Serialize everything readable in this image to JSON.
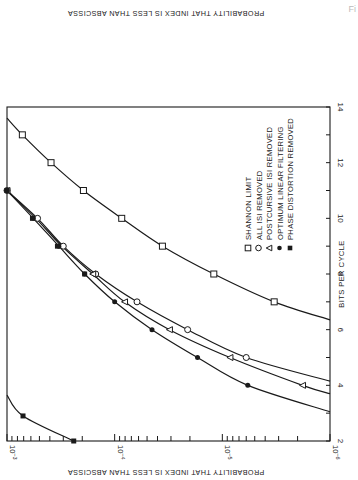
{
  "chart_data": {
    "type": "line",
    "title": "",
    "xlabel": "BITS PER CYCLE",
    "ylabel": "PROBABILITY THAT INDEX IS LESS THAN ABSCISSA",
    "top_label_mirrored": "PROBABILITY THAT INDEX IS LESS THAN ABSCISSA",
    "orientation": "rotated 90 degrees clockwise (bits axis vertical on right, probability axis horizontal at bottom)",
    "xlim": [
      2,
      14
    ],
    "ylim": [
      1e-06,
      0.001
    ],
    "yscale": "log",
    "x_ticks": [
      2,
      4,
      6,
      8,
      10,
      12,
      14
    ],
    "y_ticks": [
      {
        "value": 0.001,
        "label": "10",
        "exp": "-3"
      },
      {
        "value": 0.0001,
        "label": "10",
        "exp": "-4"
      },
      {
        "value": 1e-05,
        "label": "10",
        "exp": "-5"
      },
      {
        "value": 1e-06,
        "label": "10",
        "exp": "-6"
      }
    ],
    "grid": false,
    "legend_position": "upper right (inside plot, rotated)",
    "series": [
      {
        "name": "SHANNON LIMIT",
        "marker": "open-square",
        "points": [
          [
            13,
            0.00072
          ],
          [
            12,
            0.00039
          ],
          [
            11,
            0.000195
          ],
          [
            10,
            8.6e-05
          ],
          [
            9,
            3.6e-05
          ],
          [
            8,
            1.2e-05
          ],
          [
            7,
            3.3e-06
          ]
        ],
        "curve": [
          [
            13.6,
            0.001
          ],
          [
            13,
            0.00072
          ],
          [
            12,
            0.00039
          ],
          [
            11,
            0.000195
          ],
          [
            10,
            8.6e-05
          ],
          [
            9,
            3.6e-05
          ],
          [
            8,
            1.2e-05
          ],
          [
            7,
            3.3e-06
          ],
          [
            6.35,
            1e-06
          ]
        ]
      },
      {
        "name": "ALL ISI REMOVED",
        "marker": "open-circle",
        "points": [
          [
            11,
            0.001
          ],
          [
            10,
            0.00052
          ],
          [
            9,
            0.0003
          ],
          [
            8,
            0.00015
          ],
          [
            7,
            6.2e-05
          ],
          [
            6,
            2.1e-05
          ],
          [
            5,
            6e-06
          ]
        ],
        "curve": [
          [
            11,
            0.001
          ],
          [
            10,
            0.00052
          ],
          [
            9,
            0.0003
          ],
          [
            8,
            0.00015
          ],
          [
            7,
            6.2e-05
          ],
          [
            6,
            2.1e-05
          ],
          [
            5,
            6e-06
          ],
          [
            4.15,
            1e-06
          ]
        ]
      },
      {
        "name": "POSTCURSIVE ISI REMOVED",
        "marker": "open-triangle",
        "points": [
          [
            11,
            0.001
          ],
          [
            8,
            0.00016
          ],
          [
            7,
            8.1e-05
          ],
          [
            6,
            3.1e-05
          ],
          [
            5,
            8.5e-06
          ],
          [
            4,
            1.8e-06
          ]
        ],
        "curve": [
          [
            11,
            0.001
          ],
          [
            10,
            0.00054
          ],
          [
            9,
            0.00031
          ],
          [
            8,
            0.00016
          ],
          [
            7,
            8.1e-05
          ],
          [
            6,
            3.1e-05
          ],
          [
            5,
            8.5e-06
          ],
          [
            4,
            1.8e-06
          ],
          [
            3.7,
            1e-06
          ]
        ]
      },
      {
        "name": "OPTIMUM LINEAR FILTERING",
        "marker": "filled-circle",
        "points": [
          [
            11,
            0.001
          ],
          [
            10,
            0.00057
          ],
          [
            9,
            0.00033
          ],
          [
            8,
            0.00019
          ],
          [
            7,
            0.0001
          ],
          [
            6,
            4.5e-05
          ],
          [
            5,
            1.7e-05
          ],
          [
            4,
            5.8e-06
          ]
        ],
        "curve": [
          [
            11,
            0.001
          ],
          [
            10,
            0.00057
          ],
          [
            9,
            0.00033
          ],
          [
            8,
            0.00019
          ],
          [
            7,
            0.0001
          ],
          [
            6,
            4.5e-05
          ],
          [
            5,
            1.7e-05
          ],
          [
            4,
            5.8e-06
          ],
          [
            3.05,
            1e-06
          ]
        ]
      },
      {
        "name": "PHASE DISTORTION REMOVED",
        "marker": "filled-square",
        "points": [
          [
            11,
            0.001
          ],
          [
            10,
            0.00058
          ],
          [
            9,
            0.00034
          ],
          [
            8,
            0.00019
          ],
          [
            2.9,
            0.00071
          ],
          [
            2,
            0.00024
          ]
        ],
        "curve": [
          [
            3.65,
            0.001
          ],
          [
            2.9,
            0.00071
          ],
          [
            2,
            0.00024
          ]
        ]
      }
    ]
  },
  "legend": {
    "items": [
      {
        "marker": "open-square",
        "label": "SHANNON LIMIT"
      },
      {
        "marker": "open-circle",
        "label": "ALL ISI REMOVED"
      },
      {
        "marker": "open-triangle",
        "label": "POSTCURSIVE ISI REMOVED"
      },
      {
        "marker": "filled-circle",
        "label": "OPTIMUM LINEAR FILTERING"
      },
      {
        "marker": "filled-square",
        "label": "PHASE DISTORTION REMOVED"
      }
    ]
  },
  "colors": {
    "ink": "#1a1a1a",
    "paper": "#ffffff"
  }
}
